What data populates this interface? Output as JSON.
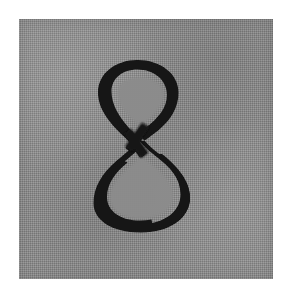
{
  "image": {
    "width": 291,
    "height": 298,
    "background_color": "#ffffff",
    "description": "Scanned grayscale image of a printed numeral on a textured gray card"
  },
  "panel": {
    "name": "scanned-gray-card",
    "x": 19,
    "y": 19,
    "width": 254,
    "height": 260,
    "fill_color": "#8b8b8b",
    "texture": "halftone-dither-checkerboard"
  },
  "glyph": {
    "character": "8",
    "label": "eight",
    "color": "#131313",
    "style": "serif-didone-high-contrast",
    "bbox": {
      "x": 76,
      "y": 41,
      "width": 95,
      "height": 172
    },
    "upper_loop": {
      "cx": 118,
      "cy": 70,
      "rx": 40,
      "ry": 44
    },
    "lower_loop": {
      "cx": 123,
      "cy": 153,
      "rx": 48,
      "ry": 60
    },
    "crossing_y": 129
  }
}
